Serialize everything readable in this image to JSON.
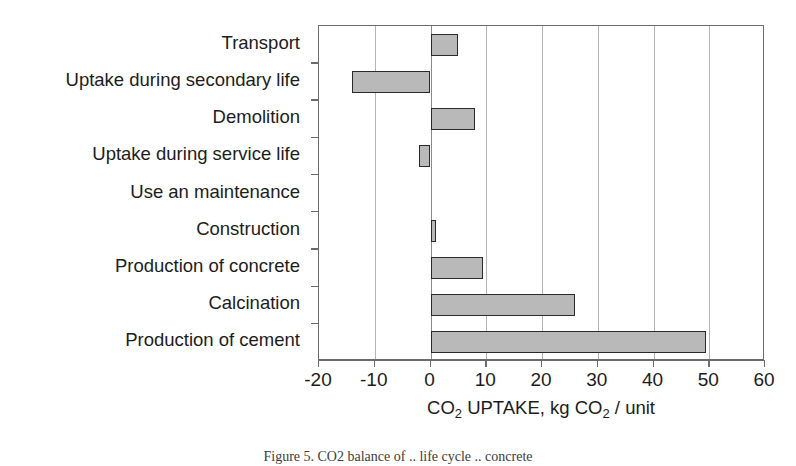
{
  "chart_data": {
    "type": "bar",
    "orientation": "horizontal",
    "title": "",
    "xlabel": "CO2 UPTAKE, kg CO2 / unit",
    "xlabel_parts": [
      "CO",
      "2",
      " UPTAKE, kg CO",
      "2",
      " / unit"
    ],
    "ylabel": "",
    "xlim": [
      -20,
      60
    ],
    "xticks": [
      -20,
      -10,
      0,
      10,
      20,
      30,
      40,
      50,
      60
    ],
    "xtick_labels": [
      "-20",
      "-10",
      "0",
      "10",
      "20",
      "30",
      "40",
      "50",
      "60"
    ],
    "grid": "vertical",
    "legend": "none",
    "bar_fill_color": "#b9b9b9",
    "bar_edge_color": "#2a2a2a",
    "categories": [
      "Transport",
      "Uptake during secondary life",
      "Demolition",
      "Uptake during service life",
      "Use an maintenance",
      "Construction",
      "Production of concrete",
      "Calcination",
      "Production of cement"
    ],
    "values": [
      5,
      -14,
      8,
      -2,
      0,
      1,
      9.5,
      26,
      49.5
    ]
  },
  "caption": {
    "text": "Figure 5.  CO2 balance of .. life cycle .. concrete"
  }
}
